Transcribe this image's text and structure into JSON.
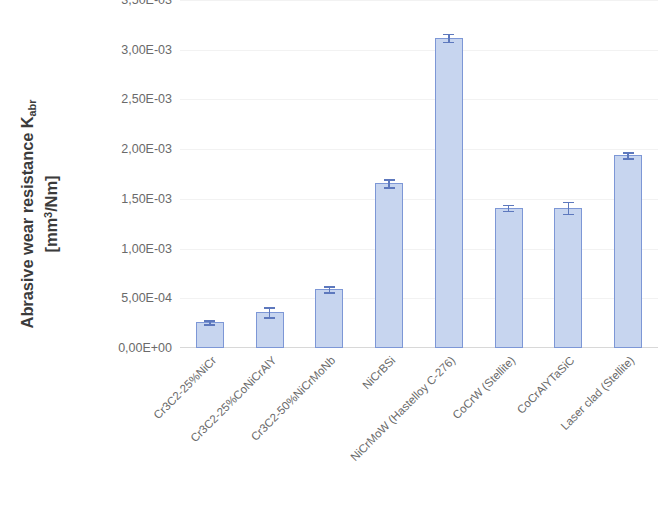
{
  "chart_data": {
    "type": "bar",
    "title": "",
    "subtitle": "",
    "xlabel": "",
    "ylabel_line1": "Abrasive wear resistance K",
    "ylabel_sub": "abr",
    "ylabel_line2_open": "[mm",
    "ylabel_sup": "3",
    "ylabel_line2_close": "/Nm]",
    "ylabel_plain": "Abrasive wear resistance Kabr [mm3/Nm]",
    "categories": [
      "Cr3C2-25%NiCr",
      "Cr3C2-25%CoNiCrAlY",
      "Cr3C2-50%NiCrMoNb",
      "NiCrBSi",
      "NiCrMoW (Hastelloy C-276)",
      "CoCrW (Stellite)",
      "CoCrAlYTaSiC",
      "Laser clad (Stellite)"
    ],
    "values": [
      0.00026,
      0.00036,
      0.00059,
      0.00166,
      0.00312,
      0.00141,
      0.00141,
      0.00194
    ],
    "errors": [
      2e-05,
      5e-05,
      3e-05,
      4e-05,
      4e-05,
      3e-05,
      6e-05,
      3e-05
    ],
    "ylim": [
      0.0,
      0.0035
    ],
    "ytick_values": [
      0.0,
      0.0005,
      0.001,
      0.0015,
      0.002,
      0.0025,
      0.003,
      0.0035
    ],
    "ytick_labels": [
      "0,00E+00",
      "5,00E-04",
      "1,00E-03",
      "1,50E-03",
      "2,00E-03",
      "2,50E-03",
      "3,00E-03",
      "3,50E-03"
    ],
    "grid": true,
    "grid_axis": "y",
    "legend": false,
    "legend_position": "none",
    "bar_fill_color": "#c7d5ef",
    "bar_border_color": "#7d97d6",
    "error_bar_color": "#5d78bd",
    "gridline_color": "#f2f2f2",
    "axis_text_color": "#6a6a6a",
    "title_text_color": "#3b3b3b",
    "background_color": "#ffffff",
    "xtick_rotation": -45
  }
}
